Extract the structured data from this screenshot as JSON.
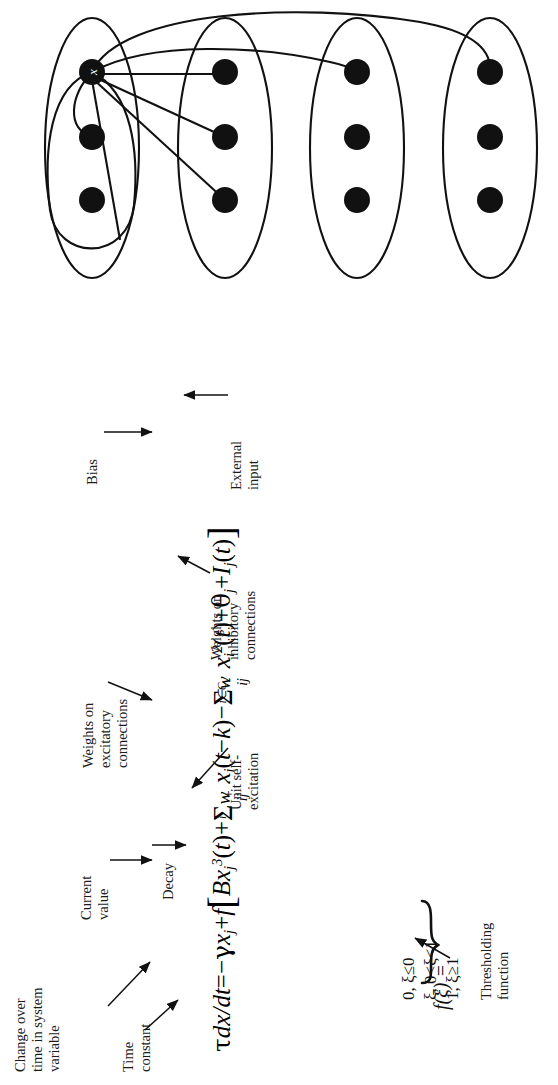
{
  "figure": {
    "diagram": {
      "label": "network-of-unit-groups",
      "group_count": 4,
      "nodes_per_group": 3,
      "highlighted_node_label": "x",
      "groups": [
        {
          "name": "group-1",
          "cx": 92,
          "cy": 148,
          "rx": 47,
          "ry": 130
        },
        {
          "name": "group-2",
          "cx": 225,
          "cy": 148,
          "rx": 47,
          "ry": 130
        },
        {
          "name": "group-3",
          "cx": 357,
          "cy": 148,
          "rx": 47,
          "ry": 130
        },
        {
          "name": "group-4",
          "cx": 490,
          "cy": 148,
          "rx": 47,
          "ry": 130
        }
      ],
      "node_rows_y": [
        72,
        137,
        200
      ],
      "node_radius": 13
    },
    "equation": {
      "main": "τdx/dt = −γx_j + f[ Bx_j^3(t) + Σ_i w_ij^+ x_i(t−k) − Σ_{i∈C} w_ij^- x_i^2(t) + θ_j + I_j(t) ]",
      "tokens": {
        "tau": "τ",
        "dxdt": "dx/dt",
        "equals": "=",
        "minus": "−",
        "gamma": "γ",
        "x": "x",
        "j": "j",
        "plus": "+",
        "f": "f",
        "bracket_open": "[",
        "bracket_close": "]",
        "B": "B",
        "three": "3",
        "t": "t",
        "sum": "Σ",
        "i": "i",
        "w": "w",
        "ij": "ij",
        "sup_plus": "+",
        "sup_minus": "-",
        "t_minus_k": "(t−k)",
        "i_in_C": "i∈C",
        "two": "2",
        "theta": "θ",
        "I": "I"
      }
    },
    "threshold": {
      "fname": "f(ξ) =",
      "cases": [
        "0,  ξ≤0",
        "ξ,  0<ξ<1",
        "1,  ξ≥1"
      ]
    },
    "callouts": [
      {
        "id": "change-over-time",
        "text": [
          "Change over",
          "time in system",
          "variable"
        ]
      },
      {
        "id": "time-constant",
        "text": [
          "Time",
          "constant"
        ]
      },
      {
        "id": "current-value",
        "text": [
          "Current",
          "value"
        ]
      },
      {
        "id": "decay",
        "text": [
          "Decay"
        ]
      },
      {
        "id": "unit-self-excitation",
        "text": [
          "Unit self-",
          "excitation"
        ]
      },
      {
        "id": "weights-excitatory",
        "text": [
          "Weights on",
          "excitatory",
          "connections"
        ]
      },
      {
        "id": "weights-inhibitory",
        "text": [
          "Weights on",
          "inhibitory",
          "connections"
        ]
      },
      {
        "id": "bias",
        "text": [
          "Bias"
        ]
      },
      {
        "id": "external-input",
        "text": [
          "External",
          "input"
        ]
      },
      {
        "id": "thresholding-function",
        "text": [
          "Thresholding",
          "function"
        ]
      }
    ],
    "colors": {
      "ink": "#111111",
      "background": "#ffffff",
      "node_fill": "#111111"
    }
  }
}
